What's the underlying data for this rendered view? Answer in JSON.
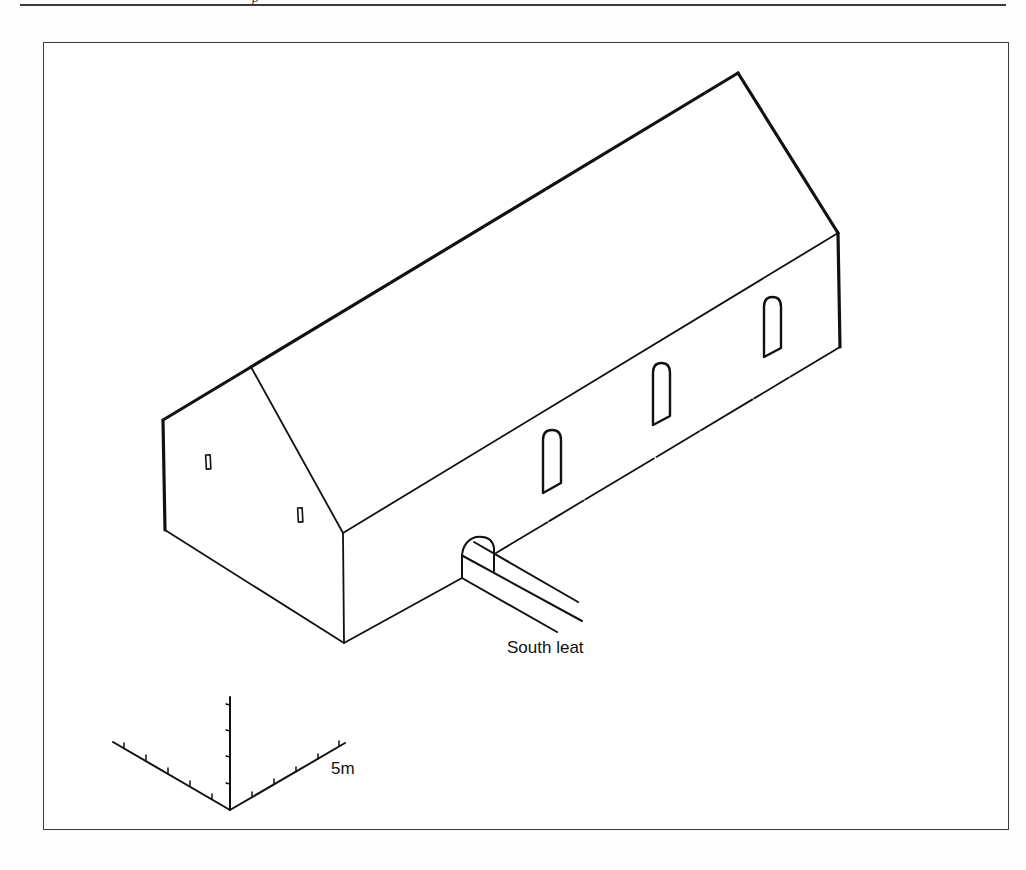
{
  "page": {
    "header_fragment": "p"
  },
  "figure": {
    "type": "isometric building diagram",
    "labels": {
      "leat": "South leat",
      "scale": "5m"
    },
    "building": {
      "gable_end_windows": 2,
      "side_arched_windows": 3,
      "arched_opening": 1
    },
    "scale_bar": {
      "axes": 3,
      "ticks_per_axis": 5,
      "length_label": "5m"
    },
    "colors": {
      "line": "#111111",
      "background": "#ffffff",
      "frame": "#3a3a3a"
    }
  }
}
